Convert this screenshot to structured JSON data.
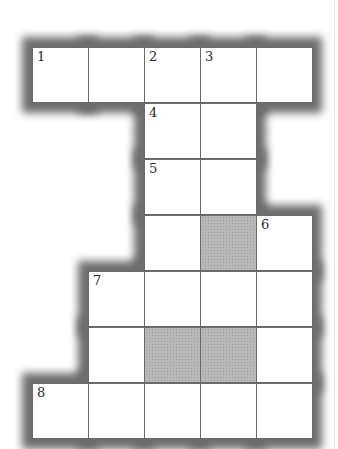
{
  "puzzle": {
    "type": "crossword",
    "cell_size": 56,
    "origin": {
      "x": 32,
      "y": 47
    },
    "columns": 5,
    "rows": 7,
    "colors": {
      "cell": "#ffffff",
      "block": "#b9b9b9",
      "border": "#6a6a6a",
      "shadow": "#6d6d6d"
    },
    "cells": [
      {
        "r": 0,
        "c": 0,
        "num": "1",
        "block": false
      },
      {
        "r": 0,
        "c": 1,
        "num": "",
        "block": false
      },
      {
        "r": 0,
        "c": 2,
        "num": "2",
        "block": false
      },
      {
        "r": 0,
        "c": 3,
        "num": "3",
        "block": false
      },
      {
        "r": 0,
        "c": 4,
        "num": "",
        "block": false
      },
      {
        "r": 1,
        "c": 2,
        "num": "4",
        "block": false
      },
      {
        "r": 1,
        "c": 3,
        "num": "",
        "block": false
      },
      {
        "r": 2,
        "c": 2,
        "num": "5",
        "block": false
      },
      {
        "r": 2,
        "c": 3,
        "num": "",
        "block": false
      },
      {
        "r": 3,
        "c": 2,
        "num": "",
        "block": false
      },
      {
        "r": 3,
        "c": 3,
        "num": "",
        "block": true
      },
      {
        "r": 3,
        "c": 4,
        "num": "6",
        "block": false
      },
      {
        "r": 4,
        "c": 1,
        "num": "7",
        "block": false
      },
      {
        "r": 4,
        "c": 2,
        "num": "",
        "block": false
      },
      {
        "r": 4,
        "c": 3,
        "num": "",
        "block": false
      },
      {
        "r": 4,
        "c": 4,
        "num": "",
        "block": false
      },
      {
        "r": 5,
        "c": 1,
        "num": "",
        "block": false
      },
      {
        "r": 5,
        "c": 2,
        "num": "",
        "block": true
      },
      {
        "r": 5,
        "c": 3,
        "num": "",
        "block": true
      },
      {
        "r": 5,
        "c": 4,
        "num": "",
        "block": false
      },
      {
        "r": 6,
        "c": 0,
        "num": "8",
        "block": false
      },
      {
        "r": 6,
        "c": 1,
        "num": "",
        "block": false
      },
      {
        "r": 6,
        "c": 2,
        "num": "",
        "block": false
      },
      {
        "r": 6,
        "c": 3,
        "num": "",
        "block": false
      },
      {
        "r": 6,
        "c": 4,
        "num": "",
        "block": false
      }
    ]
  }
}
